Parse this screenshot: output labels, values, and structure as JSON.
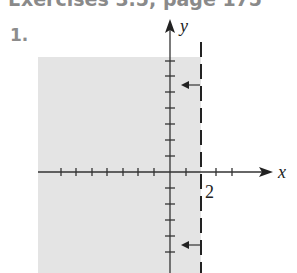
{
  "header": {
    "title": "Exercises 3.5, page 175",
    "problem_number": "1."
  },
  "graph": {
    "x_axis_label": "x",
    "y_axis_label": "y",
    "boundary_label": "2",
    "boundary": "x = 2 (dashed)",
    "shaded_region": "x < 2",
    "colors": {
      "shade": "#e4e4e4",
      "axis": "#333333",
      "text_gray": "#8a8a8a"
    }
  }
}
